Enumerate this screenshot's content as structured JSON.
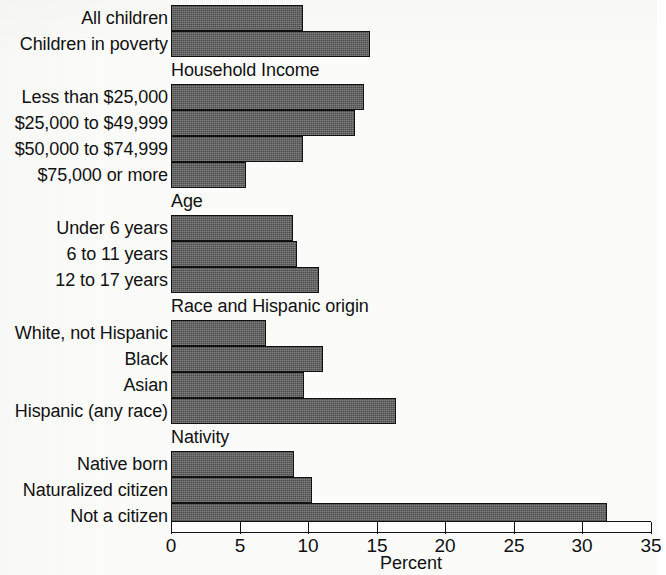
{
  "chart_data": {
    "type": "bar",
    "orientation": "horizontal",
    "title": "",
    "xlabel": "Percent",
    "ylabel": "",
    "xlim": [
      0,
      35
    ],
    "xticks": [
      0,
      5,
      10,
      15,
      20,
      25,
      30,
      35
    ],
    "xtick_labels": [
      "0",
      "5",
      "10",
      "15",
      "20",
      "25",
      "30",
      "35"
    ],
    "grid": false,
    "legend": null,
    "bar_color": "#5c5c5c",
    "bar_edge_color": "#111111",
    "groups": [
      {
        "header": "",
        "items": [
          {
            "label": "All children",
            "value": 9.6
          },
          {
            "label": "Children in poverty",
            "value": 14.5
          }
        ]
      },
      {
        "header": "Household Income",
        "items": [
          {
            "label": "Less than $25,000",
            "value": 14.1
          },
          {
            "label": "$25,000 to $49,999",
            "value": 13.4
          },
          {
            "label": "$50,000 to $74,999",
            "value": 9.6
          },
          {
            "label": "$75,000 or more",
            "value": 5.5
          }
        ]
      },
      {
        "header": "Age",
        "items": [
          {
            "label": "Under 6 years",
            "value": 8.9
          },
          {
            "label": "6 to 11 years",
            "value": 9.2
          },
          {
            "label": "12 to 17 years",
            "value": 10.8
          }
        ]
      },
      {
        "header": "Race and Hispanic origin",
        "items": [
          {
            "label": "White, not Hispanic",
            "value": 6.9
          },
          {
            "label": "Black",
            "value": 11.1
          },
          {
            "label": "Asian",
            "value": 9.7
          },
          {
            "label": "Hispanic (any race)",
            "value": 16.4
          }
        ]
      },
      {
        "header": "Nativity",
        "items": [
          {
            "label": "Native born",
            "value": 9.0
          },
          {
            "label": "Naturalized citizen",
            "value": 10.3
          },
          {
            "label": "Not a citizen",
            "value": 31.8
          }
        ]
      }
    ],
    "categories": [
      "All children",
      "Children in poverty",
      "Less than $25,000",
      "$25,000 to $49,999",
      "$50,000 to $74,999",
      "$75,000 or more",
      "Under 6 years",
      "6 to 11 years",
      "12 to 17 years",
      "White, not Hispanic",
      "Black",
      "Asian",
      "Hispanic (any race)",
      "Native born",
      "Naturalized citizen",
      "Not a citizen"
    ],
    "values": [
      9.6,
      14.5,
      14.1,
      13.4,
      9.6,
      5.5,
      8.9,
      9.2,
      10.8,
      6.9,
      11.1,
      9.7,
      16.4,
      9.0,
      10.3,
      31.8
    ]
  }
}
